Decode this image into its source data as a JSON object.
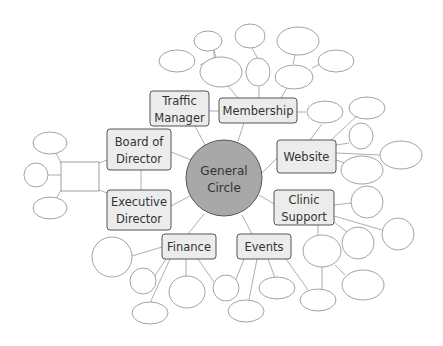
{
  "diagram": {
    "type": "mind-map",
    "center": {
      "label_line1": "General",
      "label_line2": "Circle",
      "fill": "#a8a8a8"
    },
    "nodes": {
      "traffic_manager": {
        "line1": "Traffic",
        "line2": "Manager"
      },
      "membership": {
        "line1": "Membership"
      },
      "board_of_director": {
        "line1": "Board of",
        "line2": "Director"
      },
      "executive_director": {
        "line1": "Executive",
        "line2": "Director"
      },
      "website": {
        "line1": "Website"
      },
      "clinic_support": {
        "line1": "Clinic",
        "line2": "Support"
      },
      "finance": {
        "line1": "Finance"
      },
      "events": {
        "line1": "Events"
      }
    },
    "box_fill": "#ececec",
    "empty_ellipse_count": 38
  }
}
